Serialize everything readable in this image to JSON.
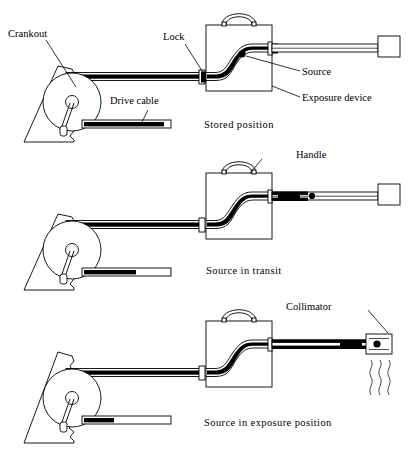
{
  "figure": {
    "type": "technical-line-diagram",
    "width": 418,
    "height": 455,
    "background_color": "#ffffff",
    "line_color": "#000000"
  },
  "labels": {
    "crankout": "Crankout",
    "drive_cable": "Drive  cable",
    "lock": "Lock",
    "source": "Source",
    "exposure_device": "Exposure device",
    "handle": "Handle",
    "collimator": "Collimator"
  },
  "panels": [
    {
      "id": "panel-stored",
      "caption": "Stored position",
      "source_location": "inside exposure device at S-bend",
      "collimator_present": false,
      "radiation_visible": false
    },
    {
      "id": "panel-transit",
      "caption": "Source in transit",
      "source_location": "in guide tube leaving exposure device",
      "collimator_present": false,
      "radiation_visible": false
    },
    {
      "id": "panel-exposure",
      "caption": "Source in exposure position",
      "source_location": "inside collimator at end of guide tube",
      "collimator_present": true,
      "radiation_visible": true,
      "radiation_rays": 3
    }
  ],
  "components": {
    "reel": "crank reel / drive cable spool",
    "crank_handle": "crank arm with knob",
    "torn_panel": "torn edge backing panel",
    "guide_tube": "guide tube",
    "end_cap": "guide tube end cap",
    "lock_block": "lock connector block",
    "device_handle": "carry handle",
    "source_pigtail": "source pigtail assembly"
  }
}
